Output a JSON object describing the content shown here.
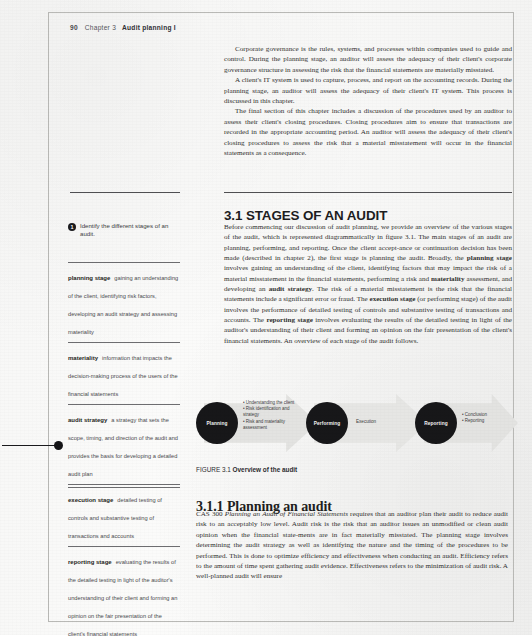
{
  "running_head": {
    "folio": "90",
    "chapter": "Chapter 3",
    "chapter_title": "Audit planning I"
  },
  "intro": {
    "p1": "Corporate governance is the rules, systems, and processes within companies used to guide and control. During the planning stage, an auditor will assess the adequacy of their client's corporate governance structure in assessing the risk that the financial statements are materially misstated.",
    "p2": "A client's IT system is used to capture, process, and report on the accounting records. During the planning stage, an auditor will assess the adequacy of their client's IT system. This process is discussed in this chapter.",
    "p3": "The final section of this chapter includes a discussion of the procedures used by an auditor to assess their client's closing procedures. Closing procedures aim to ensure that transactions are recorded in the appropriate accounting period. An auditor will assess the adequacy of their client's closing procedures to assess the risk that a material misstatement will occur in the financial statements as a consequence."
  },
  "section": {
    "number": "3.1",
    "title": "STAGES OF AN AUDIT",
    "heading": "3.1 STAGES OF AN AUDIT",
    "para_1_a": "Before commencing our discussion of audit planning, we provide an overview of the various stages of the audit, which is represented diagrammatically in figure 3.1. The main stages of an audit are planning, performing, and reporting. Once the client accept-ance or continuation decision has been made (described in chapter 2), the first stage is planning the audit. Broadly, the ",
    "term_planning_stage": "planning stage",
    "para_1_b": " involves gaining an understanding of the client, identifying factors that may impact the risk of a material misstatement in the financial statements, performing a risk and ",
    "term_materiality": "materiality",
    "para_1_c": " assessment, and developing an ",
    "term_audit_strategy": "audit strategy",
    "para_1_d": ". The risk of a material misstatement is the risk that the financial statements include a significant error or fraud. The ",
    "term_execution_stage": "execution stage",
    "para_1_e": " (or performing stage) of the audit involves the performance of detailed testing of controls and substantive testing of transactions and accounts. The ",
    "term_reporting_stage": "reporting stage",
    "para_1_f": " involves evaluating the results of the detailed testing in light of the auditor's understanding of their client and forming an opinion on the fair presentation of the client's financial statements. An overview of each stage of the audit follows."
  },
  "learning_objective": {
    "badge": "1",
    "text": "Identify the different stages of an audit."
  },
  "glossary": [
    {
      "term": "planning stage",
      "definition": "gaining an understanding of the client, identifying risk factors, developing an audit strategy and assessing materiality"
    },
    {
      "term": "materiality",
      "definition": "information that impacts the decision-making process of the users of the financial statements"
    },
    {
      "term": "audit strategy",
      "definition": "a strategy that sets the scope, timing, and direction of the audit and provides the basis for developing a detailed audit plan"
    },
    {
      "term": "execution stage",
      "definition": "detailed testing of controls and substantive testing of transactions and accounts"
    },
    {
      "term": "reporting stage",
      "definition": "evaluating the results of the detailed testing in light of the auditor's understanding of their client and forming an opinion on the fair presentation of the client's financial statements"
    }
  ],
  "figure": {
    "caption_lead": "FIGURE 3.1",
    "caption_title": "Overview of the audit",
    "stages": [
      {
        "name": "Planning",
        "bullets": [
          "• Understanding the client",
          "• Risk identification and strategy",
          "• Risk and materiality assessment"
        ]
      },
      {
        "name": "Performing",
        "bullets": [
          "Execution"
        ]
      },
      {
        "name": "Reporting",
        "bullets": [
          "• Conclusion",
          "• Reporting"
        ]
      }
    ],
    "middle_label": "Execution",
    "arrow_color": "#e3e3e1",
    "circle_color": "#171719"
  },
  "subsection": {
    "heading": "3.1.1 Planning an audit",
    "standard_code": "CAS 300",
    "standard_title": "Planning an Audit of Financial Statements",
    "body_a": " requires that an auditor plan their audit to reduce audit risk to an acceptably low level. Audit risk is the risk that an auditor issues an unmodified or clean audit opinion when the financial state-ments are in fact materially misstated. The planning stage involves determining the audit strategy as well as identifying the nature and the timing of the procedures to be performed. This is done to optimize efficiency and effectiveness when conducting an audit. Efficiency refers to the amount of time spent gathering audit evidence. Effectiveness refers to the minimization of audit risk. A well-planned audit will ensure"
  }
}
